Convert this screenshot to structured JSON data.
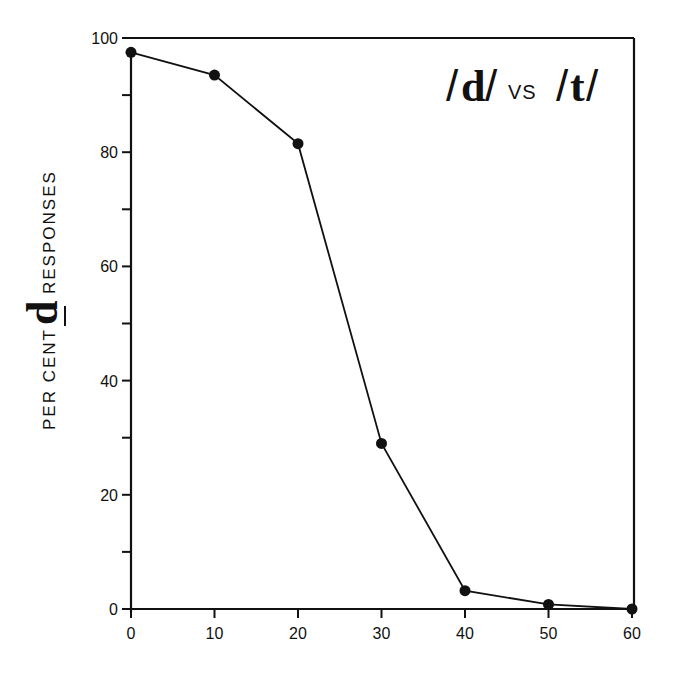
{
  "chart_data": {
    "type": "line",
    "title_parts": {
      "slash_open_1": "/",
      "phoneme_1": "d",
      "slash_close_1": "/",
      "vs": "VS",
      "slash_open_2": "/",
      "phoneme_2": "t",
      "slash_close_2": "/"
    },
    "xlabel": "",
    "ylabel": "PER CENT d RESPONSES",
    "ylabel_parts": {
      "prefix": "PER CENT",
      "symbol": "d",
      "suffix": "RESPONSES"
    },
    "x": [
      0,
      10,
      20,
      30,
      40,
      50,
      60
    ],
    "series": [
      {
        "name": "/d/ responses",
        "values": [
          97.5,
          93.5,
          81.5,
          29,
          3.2,
          0.8,
          0
        ]
      }
    ],
    "xlim": [
      0,
      60
    ],
    "ylim": [
      0,
      100
    ],
    "x_ticks": [
      "0",
      "10",
      "20",
      "30",
      "40",
      "50",
      "60"
    ],
    "y_ticks": [
      "0",
      "20",
      "40",
      "60",
      "80",
      "100"
    ],
    "y_minor_ticks": [
      10,
      30,
      50,
      70,
      90
    ],
    "grid": false,
    "legend": null,
    "marker": "filled-circle",
    "line_color": "#111111"
  }
}
